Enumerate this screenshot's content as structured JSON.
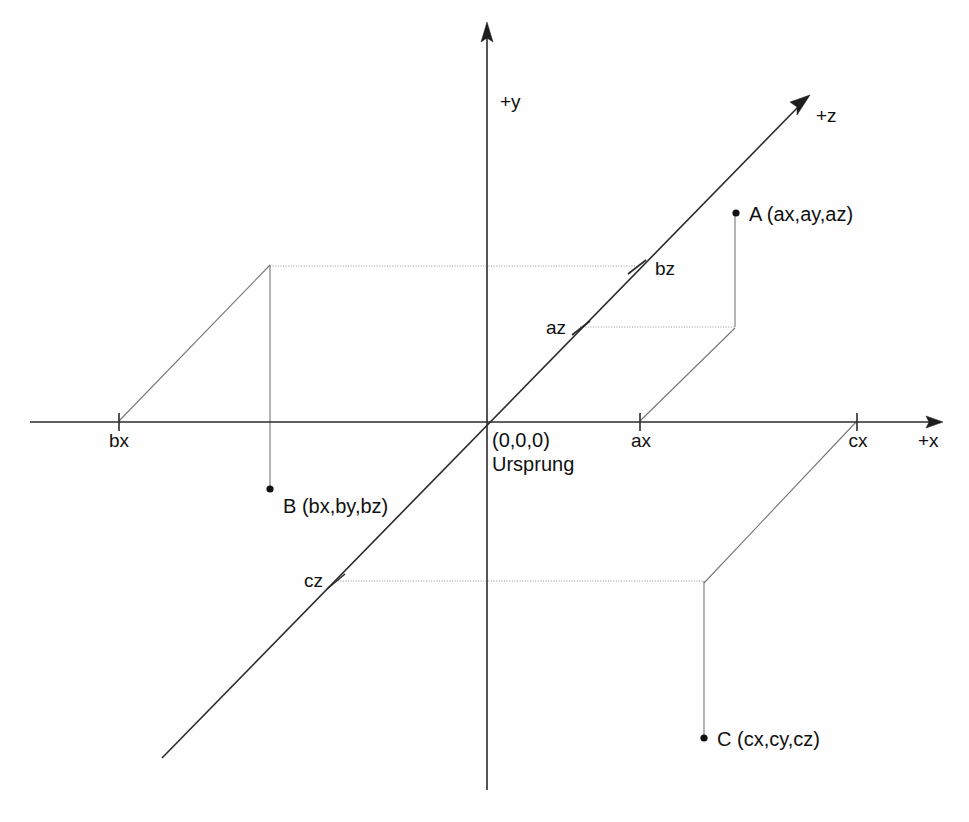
{
  "diagram": {
    "background_color": "#fefefe",
    "axis_color": "#2b2b2b",
    "construction_color": "#767676",
    "point_color": "#111111",
    "axes": [
      {
        "id": "x",
        "label": "+x",
        "direction": "right"
      },
      {
        "id": "y",
        "label": "+y",
        "direction": "up"
      },
      {
        "id": "z",
        "label": "+z",
        "direction": "up-right"
      }
    ],
    "origin": {
      "coordinates_label": "(0,0,0)",
      "name_label": "Ursprung"
    },
    "ticks": [
      {
        "id": "bx",
        "label": "bx",
        "axis": "x"
      },
      {
        "id": "ax",
        "label": "ax",
        "axis": "x"
      },
      {
        "id": "cx",
        "label": "cx",
        "axis": "x"
      },
      {
        "id": "bz",
        "label": "bz",
        "axis": "z"
      },
      {
        "id": "az",
        "label": "az",
        "axis": "z"
      },
      {
        "id": "cz",
        "label": "cz",
        "axis": "z"
      }
    ],
    "points": [
      {
        "id": "A",
        "label": "A (ax,ay,az)",
        "components": [
          "ax",
          "ay",
          "az"
        ]
      },
      {
        "id": "B",
        "label": "B (bx,by,bz)",
        "components": [
          "bx",
          "by",
          "bz"
        ]
      },
      {
        "id": "C",
        "label": "C (cx,cy,cz)",
        "components": [
          "cx",
          "cy",
          "cz"
        ]
      }
    ]
  }
}
